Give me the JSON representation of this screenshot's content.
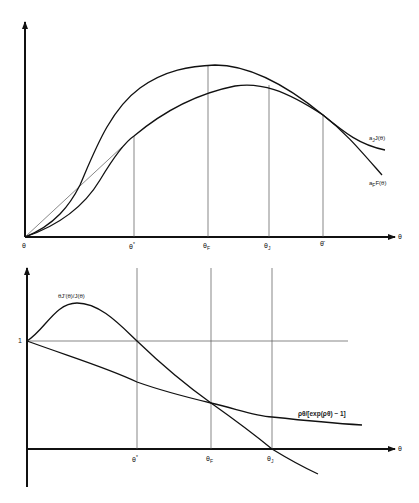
{
  "top_chart": {
    "x_axis_label": "θ",
    "origin_label": "θ",
    "ticks": [
      {
        "label": "θ",
        "sub": "*",
        "x": 134
      },
      {
        "label": "θ",
        "sub": "F",
        "x": 208
      },
      {
        "label": "θ",
        "sub": "J",
        "x": 269
      },
      {
        "label": "θ̄",
        "sub": "",
        "x": 323
      }
    ],
    "curves": [
      {
        "name": "aJ J(θ)",
        "label_main": "a",
        "label_sub": "J",
        "label_rest": "J(θ)"
      },
      {
        "name": "aF F(θ)",
        "label_main": "a",
        "label_sub": "F",
        "label_rest": "F(θ)"
      }
    ]
  },
  "bottom_chart": {
    "x_axis_label": "θ",
    "y_tick_label": "1",
    "ticks": [
      {
        "label": "θ",
        "sub": "*",
        "x": 137
      },
      {
        "label": "θ",
        "sub": "F",
        "x": 211
      },
      {
        "label": "θ",
        "sub": "J",
        "x": 272
      }
    ],
    "curves": [
      {
        "name": "θJ'(θ)/J(θ)",
        "label": "θJ'(θ)/J(θ)"
      },
      {
        "name": "ρθ/[exp(ρθ) − 1]",
        "label": "ρθ/[exp(ρθ) − 1]"
      }
    ]
  }
}
